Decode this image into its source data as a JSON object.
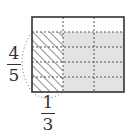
{
  "diagram": {
    "rect": {
      "x": 32,
      "y": 17,
      "width": 92,
      "height": 75
    },
    "columns": 3,
    "rows": 5,
    "shaded_rows": 4,
    "hatched_columns": 1,
    "colors": {
      "outline": "#333333",
      "dashed": "#555555",
      "shade": "#e3e3e3",
      "hatch": "#444444"
    },
    "labels": {
      "vertical": {
        "numerator": "4",
        "denominator": "5"
      },
      "horizontal": {
        "numerator": "1",
        "denominator": "3"
      }
    }
  }
}
